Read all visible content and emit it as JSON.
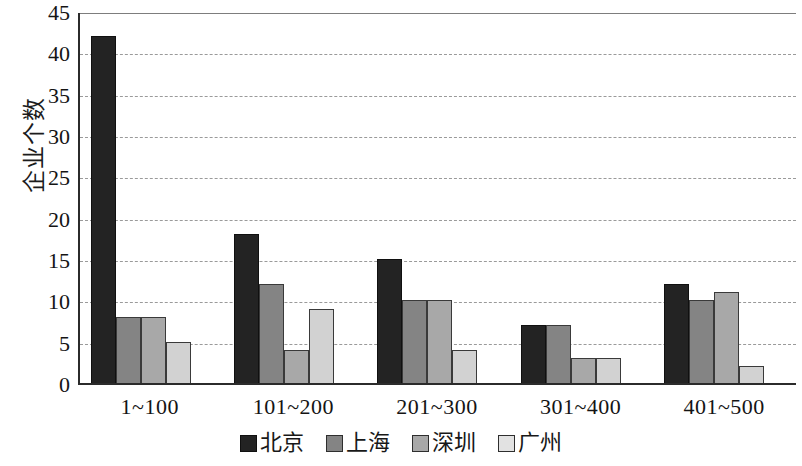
{
  "chart_data": {
    "type": "bar",
    "title": "",
    "subtitle": "",
    "xlabel": "",
    "ylabel": "企业个数",
    "ylim": [
      0,
      45
    ],
    "ytick_interval": 5,
    "yticks": [
      0,
      5,
      10,
      15,
      20,
      25,
      30,
      35,
      40,
      45
    ],
    "ytick_labels": [
      "0",
      "5",
      "10",
      "15",
      "20",
      "25",
      "30",
      "35",
      "40",
      "45"
    ],
    "grid": true,
    "grid_axis": "y",
    "grid_style": "dashed",
    "legend_position": "bottom",
    "categories": [
      "1~100",
      "101~200",
      "201~300",
      "301~400",
      "401~500"
    ],
    "series": [
      {
        "name": "北京",
        "color": "#232323",
        "values": [
          42,
          18,
          15,
          7,
          12
        ]
      },
      {
        "name": "上海",
        "color": "#848484",
        "values": [
          8,
          12,
          10,
          7,
          10
        ]
      },
      {
        "name": "深圳",
        "color": "#a8a8a8",
        "values": [
          8,
          4,
          10,
          3,
          11
        ]
      },
      {
        "name": "广州",
        "color": "#d2d2d2",
        "values": [
          5,
          9,
          4,
          3,
          2
        ]
      }
    ]
  },
  "legend": {
    "items": [
      {
        "label": "北京"
      },
      {
        "label": "上海"
      },
      {
        "label": "深圳"
      },
      {
        "label": "广州"
      }
    ]
  }
}
